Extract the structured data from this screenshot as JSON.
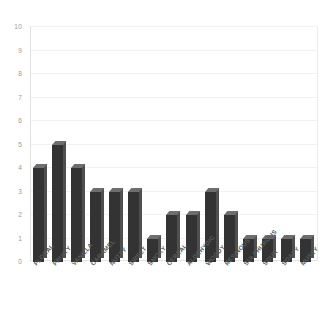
{
  "chart_data": {
    "type": "bar",
    "title": "",
    "subtitle": "",
    "xlabel": "",
    "ylabel": "",
    "ylim": [
      0,
      10
    ],
    "yticks": [
      0,
      1,
      2,
      3,
      4,
      5,
      6,
      7,
      8,
      9,
      10
    ],
    "grid": true,
    "legend": false,
    "legend_position": "none",
    "style": "3d-column",
    "bar_color": "#333333",
    "bar_side_color": "#4f4f4f",
    "bar_top_color": "#6e6e6e",
    "frame_color": "#e2e2e2",
    "tick_label_color": "#9a9a9a",
    "category_label_color": "#5a5a5a",
    "categories": [
      "FLORAL",
      "FRUITY",
      "VANILLA",
      "CARAMEL",
      "NUTTY",
      "SWEET",
      "SMOKY",
      "CEREAL",
      "ALDEHYDIC",
      "WOODY",
      "RESINOUS",
      "SULPHUROUS",
      "SOUR",
      "SOAPY",
      "MUSTY"
    ],
    "values": [
      4,
      5,
      4,
      3,
      3,
      3,
      1,
      2,
      2,
      3,
      2,
      1,
      1,
      1,
      1
    ]
  }
}
